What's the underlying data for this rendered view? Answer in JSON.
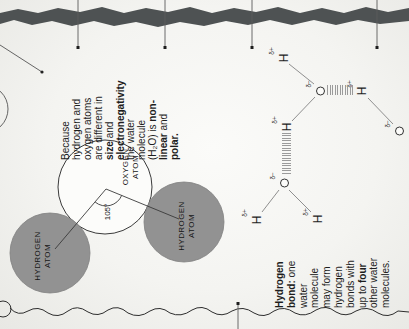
{
  "colors": {
    "background": "#f3f3f0",
    "torn_edge": "#4e5253",
    "hydrogen_circle_fill": "#929292",
    "oxygen_circle_fill": "#fcfcfa",
    "outline": "#3a3a3a",
    "text": "#1d1d1d",
    "hatch": "#9b9b9b"
  },
  "captions": {
    "polarity": {
      "lines": [
        [
          {
            "t": "Because"
          }
        ],
        [
          {
            "t": "hydrogen and"
          }
        ],
        [
          {
            "t": "oxygen atoms"
          }
        ],
        [
          {
            "t": "are different in"
          }
        ],
        [
          {
            "t": "size",
            "b": true
          },
          {
            "t": " and"
          }
        ],
        [
          {
            "t": "electronegativity",
            "b": true
          }
        ],
        [
          {
            "t": "the water"
          }
        ],
        [
          {
            "t": "molecule"
          }
        ],
        [
          {
            "t": "(H₂O) is "
          },
          {
            "t": "non-",
            "b": true
          }
        ],
        [
          {
            "t": "linear",
            "b": true
          },
          {
            "t": " and"
          }
        ],
        [
          {
            "t": "polar.",
            "b": true
          }
        ]
      ]
    },
    "hydrogen_bond": {
      "lines": [
        [
          {
            "t": "Hydrogen",
            "b": true
          }
        ],
        [
          {
            "t": "bond:",
            "b": true
          },
          {
            "t": " one"
          }
        ],
        [
          {
            "t": "water"
          }
        ],
        [
          {
            "t": "molecule"
          }
        ],
        [
          {
            "t": "may form"
          }
        ],
        [
          {
            "t": "hydrogen"
          }
        ],
        [
          {
            "t": "bonds with"
          }
        ],
        [
          {
            "t": "up to "
          },
          {
            "t": "four",
            "b": true
          }
        ],
        [
          {
            "t": "other water"
          }
        ],
        [
          {
            "t": "molecules."
          }
        ]
      ]
    }
  },
  "atom_diagram": {
    "oxygen": {
      "label": [
        "OXYGEN",
        "ATOM"
      ]
    },
    "hydrogen_left": {
      "label": [
        "HYDROGEN",
        "ATOM"
      ]
    },
    "hydrogen_right": {
      "label": [
        "HYDROGEN",
        "ATOM"
      ]
    },
    "bond_angle": "105°"
  },
  "network": {
    "atoms": [
      {
        "symbol": "H",
        "charge": "δ+",
        "x": 271,
        "y": 283
      },
      {
        "symbol": "O",
        "charge": "δ−",
        "x": 238,
        "y": 320
      },
      {
        "symbol": "H",
        "charge": "δ+",
        "x": 202,
        "y": 286
      },
      {
        "symbol": "H",
        "charge": "δ+",
        "x": 238,
        "y": 361
      },
      {
        "symbol": "O",
        "charge": "δ−",
        "x": 198,
        "y": 399
      },
      {
        "symbol": "O",
        "charge": "δ−",
        "x": 146,
        "y": 284
      },
      {
        "symbol": "H",
        "charge": "δ+",
        "x": 109,
        "y": 256
      },
      {
        "symbol": "H",
        "charge": "δ+",
        "x": 110,
        "y": 317
      }
    ],
    "covalent_bonds": [
      [
        265,
        289,
        245,
        314
      ],
      [
        208,
        292,
        232,
        315
      ],
      [
        231,
        368,
        205,
        393
      ],
      [
        139,
        279,
        117,
        262
      ],
      [
        139,
        289,
        117,
        311
      ]
    ],
    "hydrogen_bonds": [
      {
        "orientation": "vertical",
        "x": 234,
        "y": 327,
        "w": 10,
        "h": 27
      },
      {
        "orientation": "horizontal",
        "x": 155,
        "y": 282,
        "w": 41,
        "h": 9
      }
    ]
  },
  "pins": {
    "top_y": [
      78,
      165,
      252,
      377
    ],
    "bottom_y": [
      238
    ]
  }
}
